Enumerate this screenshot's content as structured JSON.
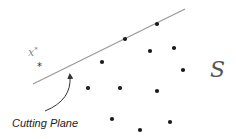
{
  "labels": {
    "x_star_base": "x",
    "x_star_sup": "*",
    "set": "S",
    "cutting_plane": "Cutting Plane"
  },
  "cutting_line": {
    "x1": 33,
    "y1": 84,
    "x2": 185,
    "y2": 9
  },
  "optimum_point": {
    "x": 41,
    "y": 65,
    "symbol": "*"
  },
  "points": [
    {
      "x": 157,
      "y": 24
    },
    {
      "x": 125,
      "y": 39
    },
    {
      "x": 150,
      "y": 51
    },
    {
      "x": 174,
      "y": 48
    },
    {
      "x": 102,
      "y": 62
    },
    {
      "x": 183,
      "y": 70
    },
    {
      "x": 88,
      "y": 88
    },
    {
      "x": 120,
      "y": 88
    },
    {
      "x": 157,
      "y": 91
    },
    {
      "x": 112,
      "y": 119
    },
    {
      "x": 140,
      "y": 130
    },
    {
      "x": 170,
      "y": 122
    }
  ],
  "colors": {
    "line": "#999999",
    "point": "#1a1a1a",
    "arrow": "#333333"
  }
}
